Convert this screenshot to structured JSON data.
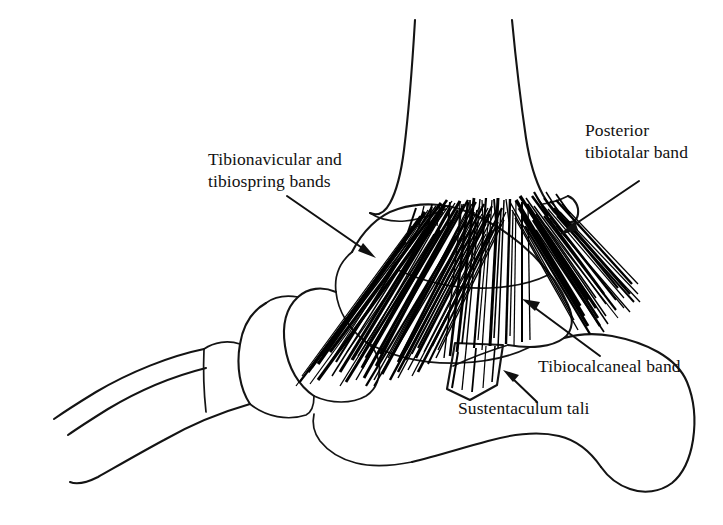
{
  "figure": {
    "background_color": "#ffffff",
    "ink_color": "#111111",
    "width": 723,
    "height": 525
  },
  "labels": [
    {
      "id": "tibionavicular",
      "name": "tibionavicular-label",
      "line1": "Tibionavicular and",
      "line2": "tibiospring bands",
      "x": 208,
      "y": 165,
      "leader": {
        "x1": 287,
        "y1": 196,
        "x2": 374,
        "y2": 257,
        "angle_deg": 35
      }
    },
    {
      "id": "posterior-tibiotalar",
      "name": "posterior-tibiotalar-label",
      "line1": "Posterior",
      "line2": "tibiotalar band",
      "x": 585,
      "y": 136,
      "leader": {
        "x1": 639,
        "y1": 181,
        "x2": 561,
        "y2": 234,
        "angle_deg": 214
      }
    },
    {
      "id": "tibiocalcaneal",
      "name": "tibiocalcaneal-label",
      "line1": "Tibiocalcaneal band",
      "line2": "",
      "x": 538,
      "y": 372,
      "leader": {
        "x1": 600,
        "y1": 356,
        "x2": 524,
        "y2": 300,
        "angle_deg": 216
      }
    },
    {
      "id": "sustentaculum-tali",
      "name": "sustentaculum-tali-label",
      "line1": "Sustentaculum tali",
      "line2": "",
      "x": 458,
      "y": 414,
      "leader": {
        "x1": 537,
        "y1": 402,
        "x2": 505,
        "y2": 371,
        "angle_deg": 224
      }
    }
  ],
  "structures": [
    {
      "id": "tibia",
      "name": "tibia-shaft-and-medial-malleolus"
    },
    {
      "id": "talus",
      "name": "talus"
    },
    {
      "id": "navicular",
      "name": "navicular"
    },
    {
      "id": "cuneiform",
      "name": "cuneiform"
    },
    {
      "id": "metatarsal",
      "name": "metatarsal"
    },
    {
      "id": "calcaneus",
      "name": "calcaneus"
    },
    {
      "id": "sustentaculum",
      "name": "sustentaculum-tali-shelf"
    },
    {
      "id": "deltoid",
      "name": "deltoid-ligament-fibers"
    }
  ]
}
